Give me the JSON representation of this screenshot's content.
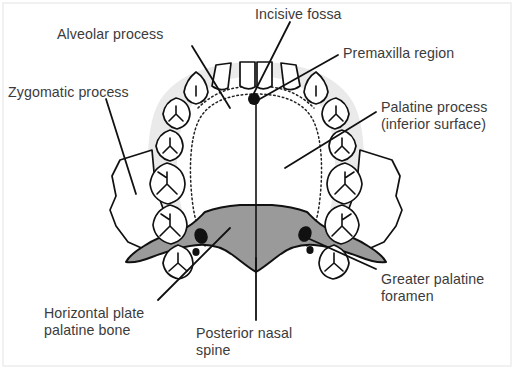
{
  "figure": {
    "background_color": "#ffffff",
    "text_color": "#3b3b3b",
    "outline_color": "#111111",
    "alveolar_shade_color": "#e8e8e8",
    "palatine_bone_color": "#9a9a9a",
    "foramen_color": "#111111",
    "border_color": "#e4e4e4"
  },
  "labels": {
    "alveolar_process": {
      "text": "Alveolar process",
      "x": 57,
      "y": 26
    },
    "zygomatic_process": {
      "text": "Zygomatic process",
      "x": 8,
      "y": 84
    },
    "incisive_fossa": {
      "text": "Incisive fossa",
      "x": 255,
      "y": 6
    },
    "premaxilla_region": {
      "text": "Premaxilla region",
      "x": 343,
      "y": 45
    },
    "palatine_process_line1": {
      "text": "Palatine process",
      "x": 381,
      "y": 99
    },
    "palatine_process_line2": {
      "text": "(inferior surface)",
      "x": 381,
      "y": 116
    },
    "greater_palatine_foramen_line1": {
      "text": "Greater palatine",
      "x": 381,
      "y": 271
    },
    "greater_palatine_foramen_line2": {
      "text": "foramen",
      "x": 381,
      "y": 288
    },
    "horizontal_plate_line1": {
      "text": "Horizontal plate",
      "x": 44,
      "y": 305
    },
    "horizontal_plate_line2": {
      "text": "palatine bone",
      "x": 44,
      "y": 322
    },
    "posterior_nasal_spine_line1": {
      "text": "Posterior nasal",
      "x": 196,
      "y": 325
    },
    "posterior_nasal_spine_line2": {
      "text": "spine",
      "x": 196,
      "y": 342
    }
  },
  "structures": [
    {
      "name": "alveolar-process",
      "kind": "dental-arch-band"
    },
    {
      "name": "zygomatic-process-left",
      "kind": "bone-outcrop"
    },
    {
      "name": "zygomatic-process-right",
      "kind": "bone-outcrop"
    },
    {
      "name": "incisive-fossa",
      "kind": "foramen-dot"
    },
    {
      "name": "premaxilla-region",
      "kind": "dotted-boundary"
    },
    {
      "name": "palatine-process",
      "kind": "palate-surface"
    },
    {
      "name": "horizontal-plate-palatine-bone",
      "kind": "shaded-bone"
    },
    {
      "name": "greater-palatine-foramen-left",
      "kind": "foramen-dot"
    },
    {
      "name": "greater-palatine-foramen-right",
      "kind": "foramen-dot"
    },
    {
      "name": "posterior-nasal-spine",
      "kind": "midline-spine"
    },
    {
      "name": "median-palatine-suture",
      "kind": "midline-suture"
    }
  ],
  "teeth": {
    "incisor_count": 4,
    "per_side_posterior_count": 6,
    "total": 16
  }
}
